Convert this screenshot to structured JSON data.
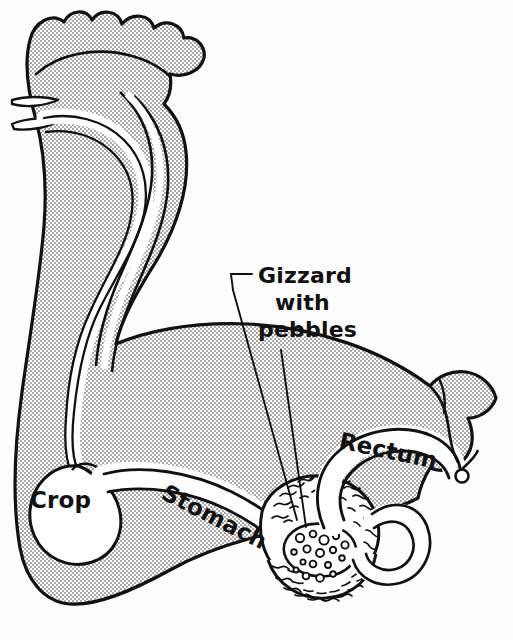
{
  "figure": {
    "style": "stippled line drawing",
    "background_color": "#fdfdfd",
    "ink_color": "#111111"
  },
  "labels": {
    "crop": "Crop",
    "stomach": "Stomach",
    "gizzard_line1": "Gizzard",
    "gizzard_line2": "with",
    "gizzard_line3": "pebbles",
    "rectum": "Rectum"
  },
  "anatomy": {
    "parts": [
      {
        "name": "comb",
        "label": ""
      },
      {
        "name": "beak",
        "label": ""
      },
      {
        "name": "esophagus",
        "label": ""
      },
      {
        "name": "crop",
        "label": "Crop"
      },
      {
        "name": "stomach",
        "label": "Stomach"
      },
      {
        "name": "gizzard",
        "label": "Gizzard with pebbles"
      },
      {
        "name": "intestine",
        "label": ""
      },
      {
        "name": "rectum",
        "label": "Rectum"
      },
      {
        "name": "vent",
        "label": ""
      }
    ]
  },
  "leader_lines": {
    "gizzard": "from Gizzard label down-left to gizzard muscle wall",
    "pebbles": "from pebbles label straight down to pebble cavity"
  }
}
